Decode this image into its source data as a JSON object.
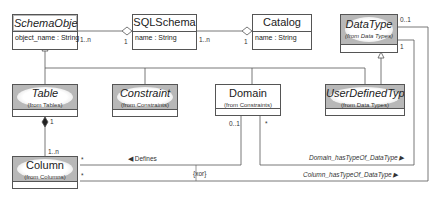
{
  "classes": {
    "schema_object": {
      "name": "SchemaObject",
      "attribute": "object_name : String"
    },
    "sql_schema": {
      "name": "SQLSchema",
      "attribute": "name : String"
    },
    "catalog": {
      "name": "Catalog",
      "attribute": "name : String"
    },
    "data_type": {
      "name": "DataType",
      "from": "(from Data Types)"
    },
    "table": {
      "name": "Table",
      "from": "(from Tables)"
    },
    "constraint": {
      "name": "Constraint",
      "from": "(from Constraints)"
    },
    "domain": {
      "name": "Domain",
      "from": "(from Constraints)"
    },
    "user_defined_type": {
      "name": "UserDefinedType",
      "from": "(from Data Types)"
    },
    "column": {
      "name": "Column",
      "from": "(from Columns)"
    }
  },
  "multiplicities": {
    "schemaobject_sqlschema_left": "1..n",
    "schemaobject_sqlschema_right": "1",
    "sqlschema_catalog_left": "1..n",
    "sqlschema_catalog_right": "1",
    "datatype_top": "0..1",
    "datatype_side": "1",
    "table_column_table": "1",
    "table_column_column": "1..n",
    "column_defines": "*",
    "column_hastype": "*",
    "domain_defines": "0..1",
    "domain_hastype": "*"
  },
  "associations": {
    "defines": "◀ Defines",
    "xor": "{xor}",
    "domain_has_type": "Domain_hasTypeOf_DataType ▶",
    "column_has_type": "Column_hasTypeOf_DataType ▶"
  },
  "colors": {
    "line": "#555555",
    "header_grey": "#b8b8b8"
  }
}
